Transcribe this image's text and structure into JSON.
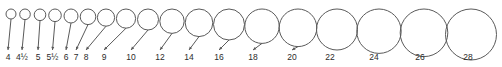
{
  "diagram": {
    "stroke_color": "#5a5a5a",
    "label_color": "#2b2b2b",
    "background_color": "#ffffff",
    "label_baseline_y": 60,
    "circle_top_y": 9,
    "items": [
      {
        "label": "4",
        "cx": 11.0,
        "cy": 14.0,
        "r": 5.0,
        "label_x": 8.0,
        "arrow_y": 50.0
      },
      {
        "label": "4½",
        "cx": 25.0,
        "cy": 14.3,
        "r": 5.3,
        "label_x": 22.0,
        "arrow_y": 50.0
      },
      {
        "label": "5",
        "cx": 40.0,
        "cy": 14.8,
        "r": 5.8,
        "label_x": 38.0,
        "arrow_y": 50.0
      },
      {
        "label": "5½",
        "cx": 55.0,
        "cy": 15.3,
        "r": 6.3,
        "label_x": 52.5,
        "arrow_y": 50.0
      },
      {
        "label": "6",
        "cx": 71.0,
        "cy": 16.0,
        "r": 7.0,
        "label_x": 66.0,
        "arrow_y": 50.0
      },
      {
        "label": "7",
        "cx": 88.0,
        "cy": 16.8,
        "r": 7.8,
        "label_x": 76.0,
        "arrow_y": 50.0
      },
      {
        "label": "8",
        "cx": 106.0,
        "cy": 17.6,
        "r": 8.6,
        "label_x": 86.0,
        "arrow_y": 50.0
      },
      {
        "label": "9",
        "cx": 126.0,
        "cy": 18.6,
        "r": 9.6,
        "label_x": 104.0,
        "arrow_y": 50.0
      },
      {
        "label": "10",
        "cx": 148.0,
        "cy": 19.5,
        "r": 10.5,
        "label_x": 131.0,
        "arrow_y": 50.0
      },
      {
        "label": "12",
        "cx": 172.0,
        "cy": 21.2,
        "r": 12.2,
        "label_x": 160.0,
        "arrow_y": 50.0
      },
      {
        "label": "14",
        "cx": 199.0,
        "cy": 22.8,
        "r": 13.8,
        "label_x": 189.0,
        "arrow_y": 50.0
      },
      {
        "label": "16",
        "cx": 229.0,
        "cy": 24.5,
        "r": 15.5,
        "label_x": 219.0,
        "arrow_y": 50.0
      },
      {
        "label": "18",
        "cx": 262.0,
        "cy": 26.2,
        "r": 17.2,
        "label_x": 253.0,
        "arrow_y": 50.0
      },
      {
        "label": "20",
        "cx": 298.0,
        "cy": 27.8,
        "r": 18.8,
        "label_x": 292.0,
        "arrow_y": 50.0
      },
      {
        "label": "22",
        "cx": 337.0,
        "cy": 29.5,
        "r": 20.5,
        "label_x": 330.0,
        "arrow_y": 50.0
      },
      {
        "label": "24",
        "cx": 379.0,
        "cy": 31.2,
        "r": 22.2,
        "label_x": 374.0,
        "arrow_y": 53.5
      },
      {
        "label": "26",
        "cx": 424.0,
        "cy": 32.8,
        "r": 23.8,
        "label_x": 420.0,
        "arrow_y": 56.0
      },
      {
        "label": "28",
        "cx": 471.0,
        "cy": 34.5,
        "r": 25.5,
        "label_x": 468.0,
        "arrow_y": 60.0
      }
    ]
  }
}
